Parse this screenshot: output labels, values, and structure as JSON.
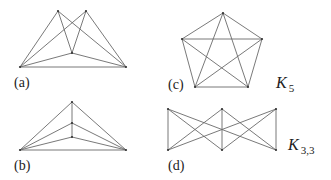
{
  "figures": [
    {
      "id": "a",
      "label": "(a)",
      "vertices": [
        [
          20,
          67
        ],
        [
          58,
          11
        ],
        [
          86,
          11
        ],
        [
          72,
          53
        ],
        [
          126,
          67
        ]
      ],
      "edges": [
        [
          0,
          1
        ],
        [
          0,
          2
        ],
        [
          0,
          3
        ],
        [
          0,
          4
        ],
        [
          1,
          3
        ],
        [
          1,
          4
        ],
        [
          2,
          3
        ],
        [
          2,
          4
        ],
        [
          3,
          4
        ]
      ]
    },
    {
      "id": "b",
      "label": "(b)",
      "vertices": [
        [
          20,
          150
        ],
        [
          72,
          102
        ],
        [
          72,
          123
        ],
        [
          72,
          137
        ],
        [
          126,
          150
        ]
      ],
      "edges": [
        [
          0,
          1
        ],
        [
          0,
          2
        ],
        [
          0,
          3
        ],
        [
          0,
          4
        ],
        [
          1,
          2
        ],
        [
          2,
          3
        ],
        [
          1,
          4
        ],
        [
          2,
          4
        ],
        [
          3,
          4
        ]
      ]
    },
    {
      "id": "c",
      "label": "(c)",
      "name": "K",
      "subscript": "5",
      "vertices": [
        [
          223,
          13
        ],
        [
          182,
          39
        ],
        [
          262,
          39
        ],
        [
          195,
          87
        ],
        [
          248,
          87
        ]
      ],
      "edges": [
        [
          0,
          1
        ],
        [
          0,
          2
        ],
        [
          0,
          3
        ],
        [
          0,
          4
        ],
        [
          1,
          2
        ],
        [
          1,
          3
        ],
        [
          1,
          4
        ],
        [
          2,
          3
        ],
        [
          2,
          4
        ],
        [
          3,
          4
        ]
      ]
    },
    {
      "id": "d",
      "label": "(d)",
      "name": "K",
      "subscript": "3,3",
      "vertices": [
        [
          168,
          109
        ],
        [
          222,
          109
        ],
        [
          276,
          109
        ],
        [
          168,
          150
        ],
        [
          222,
          150
        ],
        [
          276,
          150
        ]
      ],
      "edges": [
        [
          0,
          3
        ],
        [
          0,
          4
        ],
        [
          0,
          5
        ],
        [
          1,
          3
        ],
        [
          1,
          4
        ],
        [
          1,
          5
        ],
        [
          2,
          3
        ],
        [
          2,
          4
        ],
        [
          2,
          5
        ]
      ]
    }
  ],
  "colors": {
    "edge": "#6a6a6a",
    "vertex": "#333333",
    "text": "#222222"
  }
}
